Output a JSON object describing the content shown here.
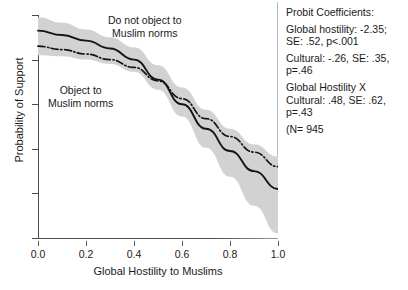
{
  "chart_data": {
    "type": "line",
    "title": "",
    "xlabel": "Global Hostility to Muslims",
    "ylabel": "Probability of Support",
    "xlim": [
      0.0,
      1.0
    ],
    "ylim": [
      0.0,
      1.0
    ],
    "grid": false,
    "legend": "none",
    "xticks": [
      "0.0",
      "0.2",
      "0.4",
      "0.6",
      "0.8",
      "1.0"
    ],
    "yticks": [
      "0.0",
      "0.2",
      "0.4",
      "0.6",
      "0.8",
      "1.0"
    ],
    "x": [
      0.0,
      0.1,
      0.2,
      0.3,
      0.4,
      0.5,
      0.6,
      0.7,
      0.8,
      0.9,
      1.0
    ],
    "series": [
      {
        "name": "solid-line",
        "style": "solid",
        "color": "#141414",
        "values": [
          0.93,
          0.91,
          0.885,
          0.85,
          0.8,
          0.71,
          0.6,
          0.49,
          0.39,
          0.3,
          0.22
        ]
      },
      {
        "name": "dash-dot-line",
        "style": "dash-dot",
        "color": "#141414",
        "values": [
          0.86,
          0.845,
          0.825,
          0.8,
          0.765,
          0.705,
          0.625,
          0.535,
          0.455,
          0.385,
          0.32
        ]
      }
    ],
    "confidence_band": {
      "name": "confidence-interval",
      "color": "#d2d2d2",
      "upper": [
        0.99,
        0.965,
        0.935,
        0.9,
        0.855,
        0.775,
        0.675,
        0.575,
        0.49,
        0.42,
        0.365
      ],
      "lower": [
        0.82,
        0.815,
        0.8,
        0.78,
        0.745,
        0.665,
        0.545,
        0.405,
        0.275,
        0.145,
        0.02
      ]
    },
    "annotations": [
      {
        "name": "annot-upper",
        "line1": "Do not object to",
        "line2": "Muslim norms"
      },
      {
        "name": "annot-lower",
        "line1": "Object to",
        "line2": "Muslim norms"
      }
    ]
  },
  "stats_panel": {
    "heading": "Probit Coefficients:",
    "blocks": [
      [
        "Global hostility: -2.35;",
        "SE: .52, p<.001"
      ],
      [
        "Cultural: -.26, SE: .35,",
        "p=.46"
      ],
      [
        "Global Hostility X",
        "Cultural: .48, SE: .62,",
        "p=.43"
      ],
      [
        "(N= 945"
      ]
    ]
  }
}
